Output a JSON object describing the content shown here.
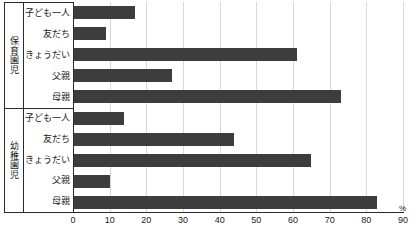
{
  "chart_data": {
    "type": "bar",
    "orientation": "horizontal",
    "title": "",
    "xlabel": "%",
    "ylabel": "",
    "xlim": [
      0,
      90
    ],
    "xticks": [
      0,
      10,
      20,
      30,
      40,
      50,
      60,
      70,
      80,
      90
    ],
    "grid": true,
    "legend": "none",
    "bar_color": "#3d3d3d",
    "groups": [
      {
        "name": "保育園児",
        "categories": [
          "子ども一人",
          "友だち",
          "きょうだい",
          "父親",
          "母親"
        ],
        "values": [
          17,
          9,
          61,
          27,
          73
        ]
      },
      {
        "name": "幼稚園児",
        "categories": [
          "子ども一人",
          "友だち",
          "きょうだい",
          "父親",
          "母親"
        ],
        "values": [
          14,
          44,
          65,
          10,
          83
        ]
      }
    ]
  }
}
